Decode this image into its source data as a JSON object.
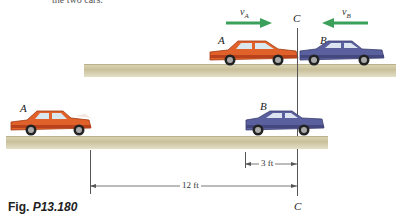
{
  "caption_top": "the two cars.",
  "figure": {
    "label_prefix": "Fig.",
    "label_number": "P13.180"
  },
  "top_scene": {
    "car_a_label": "A",
    "car_b_label": "B",
    "velocity_a": {
      "symbol": "v",
      "subscript": "A",
      "direction": "right"
    },
    "velocity_b": {
      "symbol": "v",
      "subscript": "B",
      "direction": "left"
    },
    "line_label": "C"
  },
  "bottom_scene": {
    "car_a_label": "A",
    "car_b_label": "B",
    "dim_short": "3 ft",
    "dim_long": "12 ft",
    "line_label": "C"
  },
  "colors": {
    "car_a": "#e0612a",
    "car_b": "#5a5f9e",
    "arrow": "#3aa05a",
    "ground": "#cfc7a2"
  }
}
